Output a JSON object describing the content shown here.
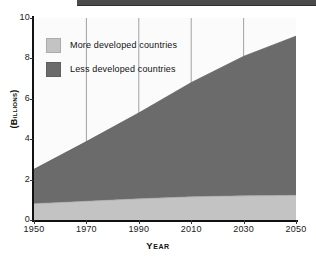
{
  "chart_data": {
    "type": "area",
    "stacked": true,
    "title": "",
    "subtitle": "",
    "xlabel": "Year",
    "ylabel": "(Billions)",
    "xlim": [
      1950,
      2050
    ],
    "ylim": [
      0,
      10
    ],
    "xticks": [
      1950,
      1970,
      1990,
      2010,
      2030,
      2050
    ],
    "yticks": [
      0,
      2,
      4,
      6,
      8,
      10
    ],
    "grid": "vertical",
    "legend_position": "upper-left-inside",
    "x": [
      1950,
      1970,
      1990,
      2010,
      2030,
      2050
    ],
    "series": [
      {
        "name": "More developed countries",
        "color": "#c3c3c3",
        "values": [
          0.81,
          0.93,
          1.05,
          1.15,
          1.2,
          1.22
        ]
      },
      {
        "name": "Less developed countries",
        "color": "#6b6b6b",
        "values": [
          1.7,
          2.95,
          4.25,
          5.65,
          6.9,
          7.88
        ]
      }
    ],
    "totals": [
      2.51,
      3.88,
      5.3,
      6.8,
      8.1,
      9.1
    ],
    "annotations": []
  },
  "axes": {
    "y_tick_labels": [
      "10",
      "8",
      "6",
      "4",
      "2",
      "0"
    ],
    "x_tick_labels": [
      "1950",
      "1970",
      "1990",
      "2010",
      "2030",
      "2050"
    ],
    "y_title": "(Billions)",
    "x_title": "Year"
  },
  "legend": {
    "items": [
      {
        "label": "More developed countries",
        "color": "#c3c3c3"
      },
      {
        "label": "Less developed countries",
        "color": "#6b6b6b"
      }
    ]
  },
  "colors": {
    "more_developed": "#c3c3c3",
    "less_developed": "#6b6b6b",
    "plot_background": "#fbfbfb",
    "axis": "#111111",
    "gridline": "#8a8a8a",
    "top_rule": "#4a4a4a"
  }
}
